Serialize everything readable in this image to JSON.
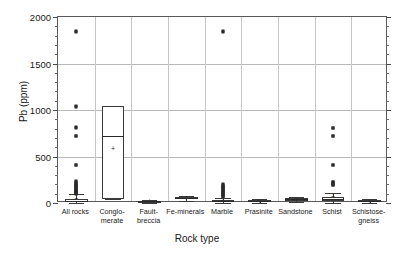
{
  "chart_data": {
    "type": "box",
    "title": "",
    "xlabel": "Rock type",
    "ylabel": "Pb (ppm)",
    "ylim": [
      0,
      2000
    ],
    "ytick_labels": [
      "0",
      "500",
      "1000",
      "1500",
      "2000"
    ],
    "ytick_values": [
      0,
      500,
      1000,
      1500,
      2000
    ],
    "yminor_step": 100,
    "grid": "horizontal",
    "legend": "none",
    "categories": [
      "All rocks",
      "Conglo-\nmerate",
      "Fault-\nbreccia",
      "Fe-minerals",
      "Marble",
      "Prasinite",
      "Sandstone",
      "Schist",
      "Schistose-\ngneiss"
    ],
    "boxes": [
      {
        "name": "All rocks",
        "q1": 8,
        "median": 22,
        "q3": 46,
        "whisker_low": 2,
        "whisker_high": 100,
        "mean": 52,
        "outliers": [
          1840,
          1845,
          1040,
          1035,
          815,
          810,
          725,
          720,
          410,
          405,
          235,
          225,
          215,
          205,
          198,
          190,
          182,
          175,
          168,
          160,
          152,
          145,
          138,
          132,
          126,
          120,
          115,
          110,
          106,
          102
        ]
      },
      {
        "name": "Conglomerate",
        "q1": 40,
        "median": 725,
        "q3": 1040,
        "whisker_low": 40,
        "whisker_high": 1040,
        "mean": 595,
        "outliers": []
      },
      {
        "name": "Fault-breccia",
        "q1": 12,
        "median": 18,
        "q3": 24,
        "whisker_low": 2,
        "whisker_high": 34,
        "mean": 18,
        "outliers": []
      },
      {
        "name": "Fe-minerals",
        "q1": 42,
        "median": 52,
        "q3": 62,
        "whisker_low": 22,
        "whisker_high": 80,
        "mean": 52,
        "outliers": []
      },
      {
        "name": "Marble",
        "q1": 8,
        "median": 18,
        "q3": 32,
        "whisker_low": 2,
        "whisker_high": 55,
        "mean": 30,
        "outliers": [
          1840,
          1845,
          200,
          192,
          184,
          176,
          168,
          160,
          152,
          144,
          136,
          128,
          120,
          112,
          104,
          96,
          88,
          80,
          72,
          66
        ]
      },
      {
        "name": "Prasinite",
        "q1": 10,
        "median": 20,
        "q3": 32,
        "whisker_low": 4,
        "whisker_high": 48,
        "mean": 24,
        "outliers": []
      },
      {
        "name": "Sandstone",
        "q1": 26,
        "median": 38,
        "q3": 50,
        "whisker_low": 16,
        "whisker_high": 60,
        "mean": 40,
        "outliers": []
      },
      {
        "name": "Schist",
        "q1": 18,
        "median": 40,
        "q3": 62,
        "whisker_low": 4,
        "whisker_high": 110,
        "mean": 70,
        "outliers": [
          810,
          805,
          725,
          720,
          410,
          405,
          230,
          222,
          214,
          206,
          198,
          190
        ]
      },
      {
        "name": "Schistose-gneiss",
        "q1": 10,
        "median": 18,
        "q3": 28,
        "whisker_low": 4,
        "whisker_high": 42,
        "mean": 20,
        "outliers": []
      }
    ],
    "mean_marker": "+",
    "colors": {
      "frame": "#5a5a5a",
      "grid": "#b9b9b9",
      "box_stroke": "#3a3a3a",
      "outlier": "#2b2b2b",
      "text": "#1a1a1a",
      "background": "#ffffff"
    }
  }
}
